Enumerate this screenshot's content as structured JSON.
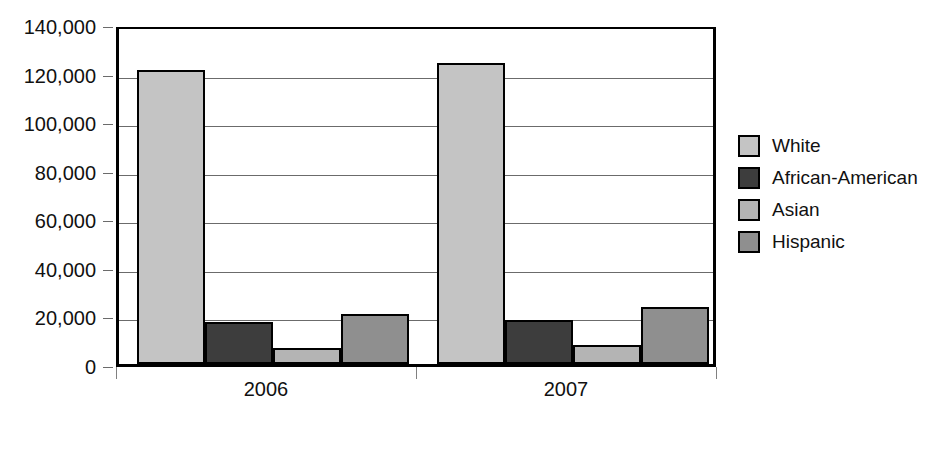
{
  "chart_data": {
    "type": "bar",
    "title": "",
    "subtitle": "",
    "xlabel": "",
    "ylabel": "",
    "categories": [
      "2006",
      "2007"
    ],
    "series": [
      {
        "name": "White",
        "color": "#c4c4c4",
        "values": [
          121000,
          124000
        ]
      },
      {
        "name": "African-American",
        "color": "#3d3d3d",
        "values": [
          17500,
          18200
        ]
      },
      {
        "name": "Asian",
        "color": "#b4b4b4",
        "values": [
          6500,
          7800
        ]
      },
      {
        "name": "Hispanic",
        "color": "#8f8f8f",
        "values": [
          20700,
          23300
        ]
      }
    ],
    "ylim": [
      0,
      140000
    ],
    "ytick_values": [
      0,
      20000,
      40000,
      60000,
      80000,
      100000,
      120000,
      140000
    ],
    "ytick_labels": [
      "0",
      "20,000",
      "40,000",
      "60,000",
      "80,000",
      "100,000",
      "120,000",
      "140,000"
    ],
    "grid": true,
    "legend_position": "right",
    "annotations": []
  },
  "legend": {
    "items": [
      {
        "label": "White",
        "swatch": "#c4c4c4"
      },
      {
        "label": "African-American",
        "swatch": "#3d3d3d"
      },
      {
        "label": "Asian",
        "swatch": "#b4b4b4"
      },
      {
        "label": "Hispanic",
        "swatch": "#8f8f8f"
      }
    ]
  },
  "axes": {
    "x_categories": [
      "2006",
      "2007"
    ]
  }
}
